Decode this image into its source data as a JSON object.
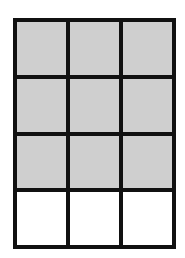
{
  "diagram": {
    "type": "grid",
    "rows": 4,
    "columns": 3,
    "total_cells": 12,
    "shaded_cells": 9,
    "unshaded_cells": 3,
    "colors": {
      "shaded": "#cfcfcf",
      "unshaded": "#ffffff",
      "border": "#111111"
    },
    "cells": [
      [
        true,
        true,
        true
      ],
      [
        true,
        true,
        true
      ],
      [
        true,
        true,
        true
      ],
      [
        false,
        false,
        false
      ]
    ]
  }
}
